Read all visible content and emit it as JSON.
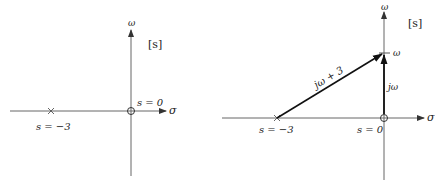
{
  "left_plot": {
    "plane_label": "[s]",
    "axis_x_label": "σ",
    "axis_y_label": "ω",
    "pole": {
      "label": "s = −3",
      "value": -3
    },
    "zero": {
      "label": "s = 0",
      "value": 0
    }
  },
  "right_plot": {
    "plane_label": "[s]",
    "axis_x_label": "σ",
    "axis_y_label": "ω",
    "pole": {
      "label": "s = −3",
      "value": -3
    },
    "zero": {
      "label": "s = 0",
      "value": 0
    },
    "omega_tick_label": "ω",
    "vector_pole_label": "jω + 3",
    "vector_zero_label": "jω"
  },
  "colors": {
    "axis": "#555555",
    "vector": "#111111",
    "text": "#222222"
  }
}
